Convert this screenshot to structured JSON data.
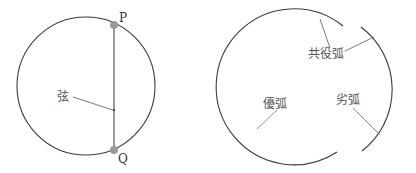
{
  "colors": {
    "circle_stroke": "#3a3a3a",
    "chord_stroke": "#9a9a9a",
    "point_fill": "#999999",
    "leader_stroke": "#555555",
    "label_text": "#555555"
  },
  "left_diagram": {
    "title": "chord",
    "points": [
      {
        "name": "P",
        "label": "P"
      },
      {
        "name": "Q",
        "label": "Q"
      }
    ],
    "chord_label": "弦"
  },
  "right_diagram": {
    "title": "arcs",
    "major_arc_label": "優弧",
    "minor_arc_label": "劣弧",
    "conjugate_arc_label": "共役弧"
  }
}
